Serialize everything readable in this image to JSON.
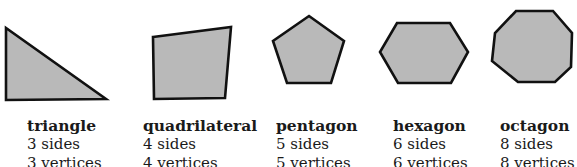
{
  "figure": {
    "shape_fill": "#b9b9b9",
    "shape_stroke": "#111111",
    "polygons": [
      {
        "name": "triangle",
        "sides_text": "3 sides",
        "vertices_text": "3 vertices",
        "sides": 3,
        "vertices": 3
      },
      {
        "name": "quadrilateral",
        "sides_text": "4 sides",
        "vertices_text": "4 vertices",
        "sides": 4,
        "vertices": 4
      },
      {
        "name": "pentagon",
        "sides_text": "5 sides",
        "vertices_text": "5 vertices",
        "sides": 5,
        "vertices": 5
      },
      {
        "name": "hexagon",
        "sides_text": "6 sides",
        "vertices_text": "6 vertices",
        "sides": 6,
        "vertices": 6
      },
      {
        "name": "octagon",
        "sides_text": "8 sides",
        "vertices_text": "8 vertices",
        "sides": 8,
        "vertices": 8
      }
    ]
  }
}
